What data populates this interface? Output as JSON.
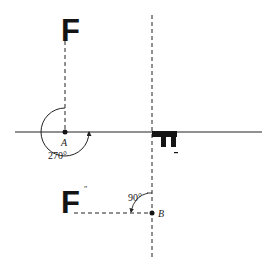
{
  "figure": {
    "shape_letter": "F",
    "prime_mark": "″",
    "points": {
      "A": {
        "label": "A"
      },
      "B": {
        "label": "B"
      }
    },
    "angles": {
      "rotation_about_A": "270°",
      "rotation_about_B": "90°"
    },
    "colors": {
      "ink": "#141414",
      "background": "#ffffff"
    }
  }
}
